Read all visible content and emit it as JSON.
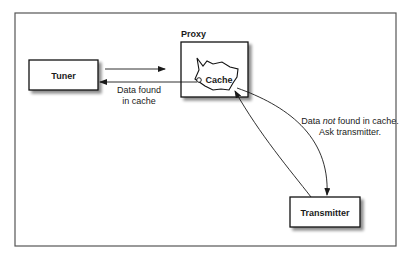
{
  "diagram": {
    "nodes": {
      "tuner": {
        "label": "Tuner"
      },
      "proxy": {
        "label": "Proxy"
      },
      "cache": {
        "label": "Cache"
      },
      "transmitter": {
        "label": "Transmitter"
      }
    },
    "edges": {
      "tuner_to_proxy": {
        "from": "Tuner",
        "to": "Proxy"
      },
      "cache_to_tuner": {
        "from": "Cache",
        "to": "Tuner",
        "label_line1": "Data found",
        "label_line2": "in cache"
      },
      "cache_to_transmitter": {
        "from": "Cache",
        "to": "Transmitter",
        "label_line1_a": "Data ",
        "label_line1_em": "not",
        "label_line1_b": " found in cache.",
        "label_line2": "Ask transmitter."
      },
      "transmitter_to_cache": {
        "from": "Transmitter",
        "to": "Cache"
      }
    }
  }
}
